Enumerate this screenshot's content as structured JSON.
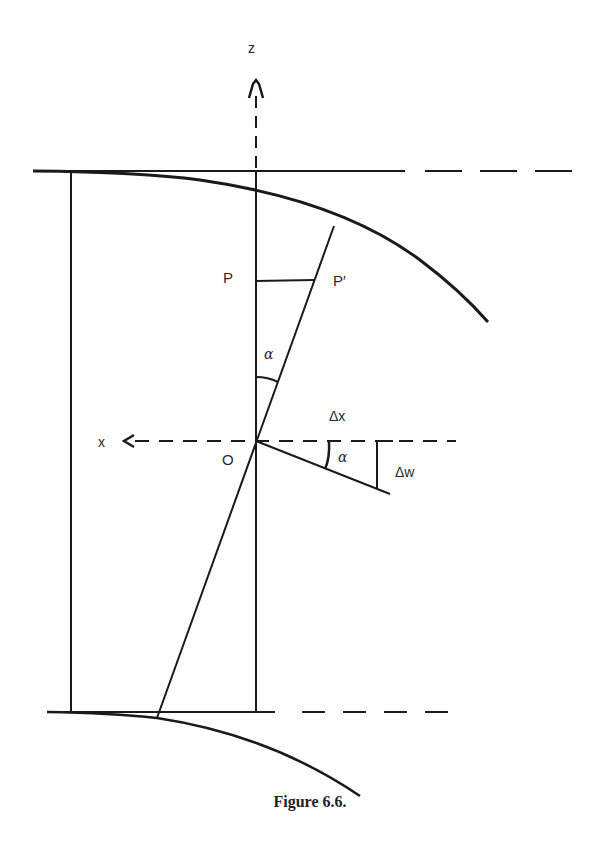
{
  "figure": {
    "caption": "Figure 6.6.",
    "labels": {
      "z_axis": "z",
      "x_axis": "x",
      "origin": "O",
      "point_p": "P",
      "point_p_prime": "P′",
      "angle_upper": "α",
      "angle_lower": "α",
      "delta_x": "Δx",
      "delta_w": "Δw"
    },
    "stroke_color": "#1a1a1a"
  }
}
